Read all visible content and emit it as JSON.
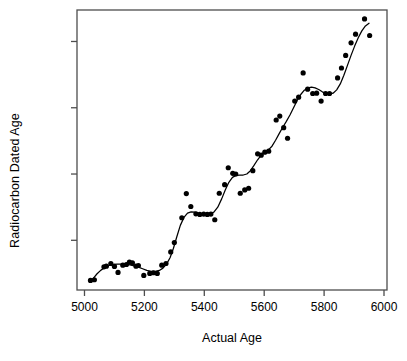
{
  "chart_data": {
    "type": "scatter",
    "title": "",
    "xlabel": "Actual Age",
    "ylabel": "Radiocarbon Dated Age",
    "xlim": [
      4975,
      6010
    ],
    "ylim": [
      4450,
      5295
    ],
    "xticks": [
      5000,
      5200,
      5400,
      5600,
      5800,
      6000
    ],
    "yticks": [
      4600,
      4800,
      5000,
      5200
    ],
    "xtick_labels": [
      "5000",
      "5200",
      "5400",
      "5600",
      "5800",
      "6000"
    ],
    "ytick_labels": [
      "4600",
      "4800",
      "5000",
      "5200"
    ],
    "grid": false,
    "legend": false,
    "point_color": "#000000",
    "line_color": "#000000",
    "frame_color": "#4d4d4d",
    "background": "#ffffff",
    "series": [
      {
        "name": "Radiocarbon samples",
        "type": "scatter",
        "marker": "filled-circle",
        "points": [
          [
            5020,
            4479
          ],
          [
            5033,
            4481
          ],
          [
            5065,
            4520
          ],
          [
            5073,
            4522
          ],
          [
            5088,
            4530
          ],
          [
            5100,
            4521
          ],
          [
            5112,
            4503
          ],
          [
            5128,
            4525
          ],
          [
            5140,
            4527
          ],
          [
            5150,
            4534
          ],
          [
            5160,
            4532
          ],
          [
            5172,
            4522
          ],
          [
            5180,
            4524
          ],
          [
            5198,
            4494
          ],
          [
            5218,
            4500
          ],
          [
            5230,
            4502
          ],
          [
            5243,
            4500
          ],
          [
            5258,
            4525
          ],
          [
            5272,
            4530
          ],
          [
            5288,
            4565
          ],
          [
            5300,
            4593
          ],
          [
            5325,
            4668
          ],
          [
            5340,
            4741
          ],
          [
            5355,
            4702
          ],
          [
            5372,
            4680
          ],
          [
            5385,
            4678
          ],
          [
            5398,
            4679
          ],
          [
            5410,
            4678
          ],
          [
            5422,
            4679
          ],
          [
            5435,
            4662
          ],
          [
            5450,
            4742
          ],
          [
            5468,
            4768
          ],
          [
            5480,
            4819
          ],
          [
            5495,
            4802
          ],
          [
            5505,
            4800
          ],
          [
            5520,
            4742
          ],
          [
            5535,
            4752
          ],
          [
            5548,
            4757
          ],
          [
            5562,
            4810
          ],
          [
            5578,
            4861
          ],
          [
            5590,
            4857
          ],
          [
            5602,
            4866
          ],
          [
            5615,
            4869
          ],
          [
            5640,
            4963
          ],
          [
            5652,
            4975
          ],
          [
            5665,
            4940
          ],
          [
            5678,
            4908
          ],
          [
            5702,
            5020
          ],
          [
            5715,
            5032
          ],
          [
            5730,
            5105
          ],
          [
            5745,
            5056
          ],
          [
            5762,
            5043
          ],
          [
            5775,
            5044
          ],
          [
            5790,
            5020
          ],
          [
            5805,
            5043
          ],
          [
            5818,
            5043
          ],
          [
            5845,
            5090
          ],
          [
            5858,
            5120
          ],
          [
            5872,
            5158
          ],
          [
            5890,
            5196
          ],
          [
            5905,
            5222
          ],
          [
            5935,
            5268
          ],
          [
            5952,
            5218
          ]
        ]
      },
      {
        "name": "Smoothed calibration curve",
        "type": "line",
        "points": [
          [
            5018,
            4473
          ],
          [
            5030,
            4486
          ],
          [
            5042,
            4499
          ],
          [
            5055,
            4510
          ],
          [
            5068,
            4518
          ],
          [
            5082,
            4524
          ],
          [
            5096,
            4527
          ],
          [
            5110,
            4528
          ],
          [
            5124,
            4528
          ],
          [
            5138,
            4527
          ],
          [
            5152,
            4526
          ],
          [
            5166,
            4523
          ],
          [
            5180,
            4519
          ],
          [
            5194,
            4514
          ],
          [
            5208,
            4509
          ],
          [
            5222,
            4506
          ],
          [
            5236,
            4506
          ],
          [
            5250,
            4509
          ],
          [
            5262,
            4516
          ],
          [
            5274,
            4528
          ],
          [
            5286,
            4548
          ],
          [
            5297,
            4576
          ],
          [
            5308,
            4610
          ],
          [
            5320,
            4645
          ],
          [
            5332,
            4669
          ],
          [
            5344,
            4682
          ],
          [
            5356,
            4686
          ],
          [
            5368,
            4685
          ],
          [
            5380,
            4682
          ],
          [
            5393,
            4680
          ],
          [
            5406,
            4679
          ],
          [
            5419,
            4680
          ],
          [
            5432,
            4685
          ],
          [
            5445,
            4700
          ],
          [
            5458,
            4725
          ],
          [
            5470,
            4752
          ],
          [
            5482,
            4775
          ],
          [
            5494,
            4790
          ],
          [
            5506,
            4796
          ],
          [
            5518,
            4797
          ],
          [
            5530,
            4797
          ],
          [
            5542,
            4800
          ],
          [
            5554,
            4810
          ],
          [
            5566,
            4826
          ],
          [
            5578,
            4843
          ],
          [
            5590,
            4857
          ],
          [
            5602,
            4866
          ],
          [
            5614,
            4873
          ],
          [
            5626,
            4884
          ],
          [
            5638,
            4902
          ],
          [
            5650,
            4922
          ],
          [
            5662,
            4941
          ],
          [
            5674,
            4959
          ],
          [
            5686,
            4978
          ],
          [
            5698,
            5000
          ],
          [
            5710,
            5022
          ],
          [
            5722,
            5040
          ],
          [
            5734,
            5053
          ],
          [
            5746,
            5060
          ],
          [
            5758,
            5062
          ],
          [
            5770,
            5060
          ],
          [
            5782,
            5055
          ],
          [
            5794,
            5048
          ],
          [
            5806,
            5043
          ],
          [
            5818,
            5041
          ],
          [
            5830,
            5044
          ],
          [
            5842,
            5054
          ],
          [
            5854,
            5072
          ],
          [
            5866,
            5098
          ],
          [
            5878,
            5128
          ],
          [
            5890,
            5158
          ],
          [
            5902,
            5186
          ],
          [
            5914,
            5211
          ],
          [
            5926,
            5232
          ],
          [
            5938,
            5247
          ],
          [
            5950,
            5255
          ]
        ]
      }
    ]
  },
  "axes": {
    "xlabel": "Actual Age",
    "ylabel": "Radiocarbon Dated Age"
  }
}
